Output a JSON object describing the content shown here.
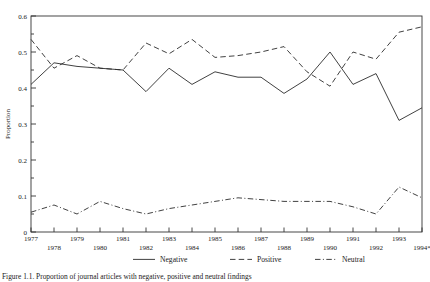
{
  "chart_data": {
    "type": "line",
    "title": "",
    "xlabel": "",
    "ylabel": "Proportion",
    "ylim": [
      0,
      0.6
    ],
    "ytick_values": [
      0,
      0.1,
      0.2,
      0.3,
      0.4,
      0.5,
      0.6
    ],
    "ytick_labels": [
      "0",
      "0.1",
      "0.2",
      "0.3",
      "0.4",
      "0.5",
      "0.6"
    ],
    "yminor_step": 0.05,
    "grid": false,
    "legend_position": "below-axes",
    "categories": [
      "1977",
      "1978",
      "1979",
      "1980",
      "1981",
      "1982",
      "1983",
      "1984",
      "1985",
      "1986",
      "1987",
      "1988",
      "1989",
      "1990",
      "1991",
      "1992",
      "1993",
      "1994*"
    ],
    "series": [
      {
        "name": "Negative",
        "style": "solid",
        "values": [
          0.41,
          0.47,
          0.46,
          0.455,
          0.45,
          0.39,
          0.455,
          0.41,
          0.445,
          0.43,
          0.43,
          0.385,
          0.425,
          0.5,
          0.41,
          0.44,
          0.31,
          0.345
        ]
      },
      {
        "name": "Positive",
        "style": "dashed",
        "values": [
          0.535,
          0.455,
          0.49,
          0.455,
          0.45,
          0.525,
          0.495,
          0.535,
          0.485,
          0.49,
          0.5,
          0.515,
          0.445,
          0.405,
          0.5,
          0.48,
          0.555,
          0.57
        ]
      },
      {
        "name": "Neutral",
        "style": "dash-dot",
        "values": [
          0.055,
          0.075,
          0.05,
          0.085,
          0.065,
          0.05,
          0.065,
          0.075,
          0.085,
          0.095,
          0.09,
          0.085,
          0.085,
          0.085,
          0.07,
          0.05,
          0.125,
          0.095
        ]
      }
    ]
  },
  "legend": {
    "items": [
      {
        "label": "Negative",
        "style": "solid"
      },
      {
        "label": "Positive",
        "style": "dashed"
      },
      {
        "label": "Neutral",
        "style": "dash-dot"
      }
    ]
  },
  "caption": {
    "text": "Figure 1.1. Proportion of journal articles with negative, positive and neutral findings"
  }
}
